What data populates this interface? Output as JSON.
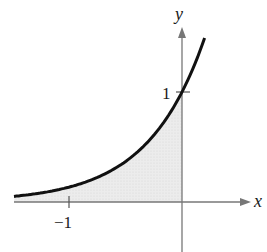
{
  "chart_data": {
    "type": "area",
    "title": "",
    "function": "y = e^(2x)",
    "xlabel": "x",
    "ylabel": "y",
    "x_ticks": [
      {
        "value": -1,
        "label": "-1"
      }
    ],
    "y_ticks": [
      {
        "value": 1,
        "label": "1"
      }
    ],
    "xlim": [
      -1.49,
      0.7
    ],
    "ylim": [
      -0.45,
      1.6
    ],
    "shaded_region": {
      "from_x": "-infinity",
      "to_x": 0,
      "between": "curve and x-axis"
    },
    "grid": false,
    "legend": "none",
    "series": [
      {
        "name": "y = e^(2x)",
        "x": [
          -1.5,
          -1.25,
          -1,
          -0.75,
          -0.5,
          -0.25,
          0,
          0.1,
          0.2
        ],
        "values": [
          0.05,
          0.082,
          0.135,
          0.223,
          0.368,
          0.607,
          1.0,
          1.221,
          1.492
        ]
      }
    ]
  },
  "labels": {
    "x_axis": "x",
    "y_axis": "y",
    "tick_x_neg1": "−1",
    "tick_y_1": "1"
  },
  "colors": {
    "curve": "#111111",
    "fill": "#e6e6e6",
    "axis": "#777777"
  }
}
